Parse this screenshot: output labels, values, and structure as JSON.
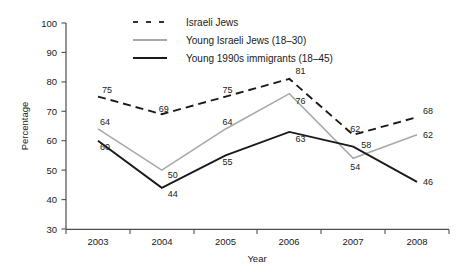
{
  "chart_data": {
    "type": "line",
    "title": "",
    "xlabel": "Year",
    "ylabel": "Percentage",
    "categories": [
      "2003",
      "2004",
      "2005",
      "2006",
      "2007",
      "2008"
    ],
    "x": [
      2003,
      2004,
      2005,
      2006,
      2007,
      2008
    ],
    "ylim": [
      30,
      100
    ],
    "yticks": [
      "30",
      "40",
      "50",
      "60",
      "70",
      "80",
      "90",
      "100"
    ],
    "grid": false,
    "legend_position": "top-center",
    "series": [
      {
        "name": "Israeli Jews",
        "style": "dashed",
        "color": "#1a1a1a",
        "values": [
          75,
          69,
          75,
          81,
          62,
          68
        ],
        "labels": [
          "75",
          "69",
          "75",
          "81",
          "62",
          "68"
        ]
      },
      {
        "name": "Young Israeli Jews (18–30)",
        "style": "solid",
        "color": "#a8a8a8",
        "values": [
          64,
          50,
          64,
          76,
          54,
          62
        ],
        "labels": [
          "64",
          "50",
          "64",
          "76",
          "54",
          "62"
        ]
      },
      {
        "name": "Young 1990s immigrants (18–45)",
        "style": "solid",
        "color": "#1a1a1a",
        "values": [
          60,
          44,
          55,
          63,
          58,
          46
        ],
        "labels": [
          "60",
          "44",
          "55",
          "63",
          "58",
          "46"
        ]
      }
    ]
  },
  "legend": {
    "items": [
      {
        "label": "Israeli Jews"
      },
      {
        "label": "Young Israeli Jews (18–30)"
      },
      {
        "label": "Young 1990s immigrants (18–45)"
      }
    ]
  },
  "axes": {
    "y_title": "Percentage",
    "x_title": "Year",
    "y_ticks": [
      "100",
      "90",
      "80",
      "70",
      "60",
      "50",
      "40",
      "30"
    ],
    "x_ticks": [
      "2003",
      "2004",
      "2005",
      "2006",
      "2007",
      "2008"
    ]
  }
}
